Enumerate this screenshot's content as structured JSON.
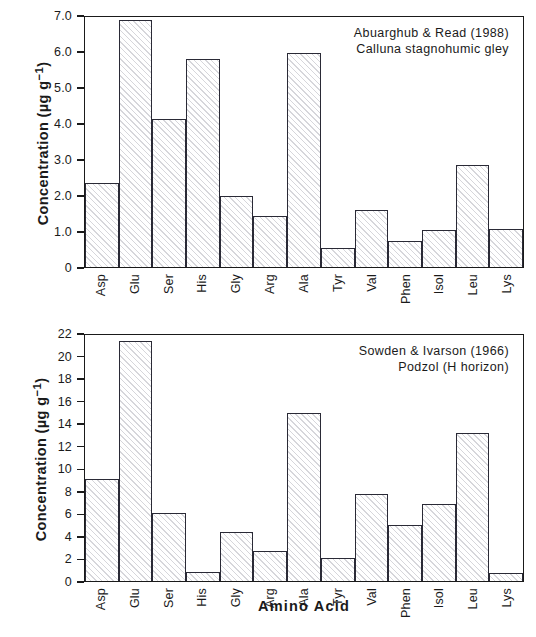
{
  "figure": {
    "x_axis_title": "Amino  Acid",
    "categories": [
      "Asp",
      "Glu",
      "Ser",
      "His",
      "Gly",
      "Arg",
      "Ala",
      "Tyr",
      "Val",
      "Phen",
      "Isol",
      "Leu",
      "Lys"
    ]
  },
  "panels": {
    "top": {
      "y_axis_title": "Concentration (µg g",
      "y_axis_title_sup": "−1",
      "y_axis_title_end": ")",
      "annotation_line1": "Abuarghub & Read (1988)",
      "annotation_line2": "Calluna stagnohumic gley",
      "y_ticks": [
        "0",
        "1.0",
        "2.0",
        "3.0",
        "4.0",
        "5.0",
        "6.0",
        "7.0"
      ]
    },
    "bottom": {
      "y_axis_title": "Concentration (µg g",
      "y_axis_title_sup": "−1",
      "y_axis_title_end": ")",
      "annotation_line1": "Sowden & Ivarson (1966)",
      "annotation_line2": "Podzol (H horizon)",
      "y_ticks": [
        "0",
        "2",
        "4",
        "6",
        "8",
        "10",
        "12",
        "14",
        "16",
        "18",
        "20",
        "22"
      ]
    }
  },
  "chart_data": [
    {
      "type": "bar",
      "id": "top",
      "title": "Abuarghub & Read (1988) — Calluna stagnohumic gley",
      "xlabel": "Amino Acid",
      "ylabel": "Concentration (µg g⁻¹)",
      "ylim": [
        0,
        7.0
      ],
      "ytick_values": [
        0,
        1.0,
        2.0,
        3.0,
        4.0,
        5.0,
        6.0,
        7.0
      ],
      "grid": false,
      "legend": "none",
      "categories": [
        "Asp",
        "Glu",
        "Ser",
        "His",
        "Gly",
        "Arg",
        "Ala",
        "Tyr",
        "Val",
        "Phen",
        "Isol",
        "Leu",
        "Lys"
      ],
      "values": [
        2.36,
        6.92,
        4.14,
        5.83,
        1.99,
        1.43,
        6.0,
        0.54,
        1.61,
        0.72,
        1.04,
        2.85,
        1.06
      ],
      "annotations": [
        "Abuarghub & Read (1988)",
        "Calluna stagnohumic gley"
      ]
    },
    {
      "type": "bar",
      "id": "bottom",
      "title": "Sowden & Ivarson (1966) — Podzol (H horizon)",
      "xlabel": "Amino Acid",
      "ylabel": "Concentration (µg g⁻¹)",
      "ylim": [
        0,
        22
      ],
      "ytick_values": [
        0,
        2,
        4,
        6,
        8,
        10,
        12,
        14,
        16,
        18,
        20,
        22
      ],
      "grid": false,
      "legend": "none",
      "categories": [
        "Asp",
        "Glu",
        "Ser",
        "His",
        "Gly",
        "Arg",
        "Ala",
        "Tyr",
        "Val",
        "Phen",
        "Isol",
        "Leu",
        "Lys"
      ],
      "values": [
        9.1,
        21.5,
        6.05,
        0.82,
        4.35,
        2.68,
        15.05,
        2.08,
        7.75,
        5.0,
        6.9,
        13.2,
        0.75
      ],
      "annotations": [
        "Sowden & Ivarson (1966)",
        "Podzol (H horizon)"
      ]
    }
  ],
  "style": {
    "axis_color": "#1a1a1a",
    "bar_edge_color": "#2a2a36",
    "bar_fill": "#ffffff",
    "hatch_color": "#78788 7",
    "background": "#ffffff"
  }
}
